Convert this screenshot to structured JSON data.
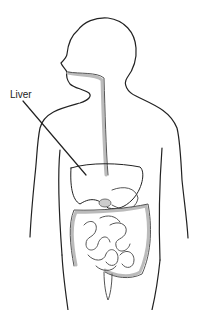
{
  "diagram": {
    "labels": [
      {
        "text": "Liver",
        "points_to": "liver"
      }
    ],
    "organs": [
      "esophagus",
      "liver",
      "stomach",
      "gallbladder",
      "small-intestine",
      "large-intestine",
      "appendix"
    ]
  }
}
